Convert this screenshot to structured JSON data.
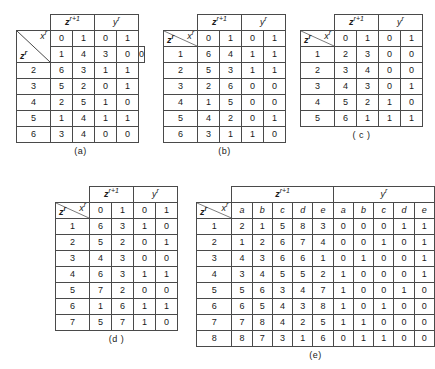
{
  "figure": {
    "headers": {
      "next_state": "z",
      "next_state_sup": "r+1",
      "output": "y",
      "output_sup": "r",
      "input_corner": "x",
      "input_corner_sup": "r",
      "state_corner": "z",
      "state_corner_sup": "r"
    },
    "tables": [
      {
        "id": "a",
        "caption": "(a)",
        "group_headers": [
          "z",
          "y"
        ],
        "input_columns": [
          "0",
          "1"
        ],
        "rows": [
          {
            "state": "1",
            "next": [
              "4",
              "3"
            ],
            "out": [
              "0",
              "0"
            ]
          },
          {
            "state": "2",
            "next": [
              "6",
              "3"
            ],
            "out": [
              "1",
              "1"
            ]
          },
          {
            "state": "3",
            "next": [
              "5",
              "2"
            ],
            "out": [
              "0",
              "1"
            ]
          },
          {
            "state": "4",
            "next": [
              "2",
              "5"
            ],
            "out": [
              "1",
              "0"
            ]
          },
          {
            "state": "5",
            "next": [
              "1",
              "4"
            ],
            "out": [
              "1",
              "1"
            ]
          },
          {
            "state": "6",
            "next": [
              "3",
              "4"
            ],
            "out": [
              "0",
              "0"
            ]
          }
        ]
      },
      {
        "id": "b",
        "caption": "(b)",
        "group_headers": [
          "z",
          "y"
        ],
        "input_columns": [
          "0",
          "1"
        ],
        "rows": [
          {
            "state": "1",
            "next": [
              "6",
              "4"
            ],
            "out": [
              "1",
              "1"
            ]
          },
          {
            "state": "2",
            "next": [
              "5",
              "3"
            ],
            "out": [
              "1",
              "1"
            ]
          },
          {
            "state": "3",
            "next": [
              "2",
              "6"
            ],
            "out": [
              "0",
              "0"
            ]
          },
          {
            "state": "4",
            "next": [
              "1",
              "5"
            ],
            "out": [
              "0",
              "0"
            ]
          },
          {
            "state": "5",
            "next": [
              "4",
              "2"
            ],
            "out": [
              "0",
              "1"
            ]
          },
          {
            "state": "6",
            "next": [
              "3",
              "1"
            ],
            "out": [
              "1",
              "0"
            ]
          }
        ]
      },
      {
        "id": "c",
        "caption": "( c )",
        "group_headers": [
          "z",
          "y"
        ],
        "input_columns": [
          "0",
          "1"
        ],
        "rows": [
          {
            "state": "1",
            "next": [
              "2",
              "3"
            ],
            "out": [
              "0",
              "0"
            ]
          },
          {
            "state": "2",
            "next": [
              "3",
              "4"
            ],
            "out": [
              "0",
              "0"
            ]
          },
          {
            "state": "3",
            "next": [
              "4",
              "3"
            ],
            "out": [
              "0",
              "1"
            ]
          },
          {
            "state": "4",
            "next": [
              "5",
              "2"
            ],
            "out": [
              "1",
              "0"
            ]
          },
          {
            "state": "5",
            "next": [
              "6",
              "1"
            ],
            "out": [
              "1",
              "1"
            ]
          }
        ]
      },
      {
        "id": "d",
        "caption": "(d )",
        "group_headers": [
          "z",
          "y"
        ],
        "input_columns": [
          "0",
          "1"
        ],
        "rows": [
          {
            "state": "1",
            "next": [
              "6",
              "3"
            ],
            "out": [
              "1",
              "0"
            ]
          },
          {
            "state": "2",
            "next": [
              "5",
              "2"
            ],
            "out": [
              "0",
              "1"
            ]
          },
          {
            "state": "3",
            "next": [
              "4",
              "3"
            ],
            "out": [
              "0",
              "0"
            ]
          },
          {
            "state": "4",
            "next": [
              "6",
              "3"
            ],
            "out": [
              "1",
              "1"
            ]
          },
          {
            "state": "5",
            "next": [
              "7",
              "2"
            ],
            "out": [
              "0",
              "0"
            ]
          },
          {
            "state": "6",
            "next": [
              "1",
              "6"
            ],
            "out": [
              "1",
              "1"
            ]
          },
          {
            "state": "7",
            "next": [
              "5",
              "7"
            ],
            "out": [
              "1",
              "0"
            ]
          }
        ]
      },
      {
        "id": "e",
        "caption": "(e)",
        "group_headers": [
          "z",
          "y"
        ],
        "input_columns": [
          "a",
          "b",
          "c",
          "d",
          "e"
        ],
        "rows": [
          {
            "state": "1",
            "next": [
              "2",
              "1",
              "5",
              "8",
              "3"
            ],
            "out": [
              "0",
              "0",
              "0",
              "1",
              "1"
            ]
          },
          {
            "state": "2",
            "next": [
              "1",
              "2",
              "6",
              "7",
              "4"
            ],
            "out": [
              "0",
              "0",
              "1",
              "0",
              "1"
            ]
          },
          {
            "state": "3",
            "next": [
              "4",
              "3",
              "6",
              "6",
              "1"
            ],
            "out": [
              "0",
              "1",
              "0",
              "0",
              "1"
            ]
          },
          {
            "state": "4",
            "next": [
              "3",
              "4",
              "5",
              "5",
              "2"
            ],
            "out": [
              "1",
              "0",
              "0",
              "0",
              "1"
            ]
          },
          {
            "state": "5",
            "next": [
              "5",
              "6",
              "3",
              "4",
              "7"
            ],
            "out": [
              "1",
              "0",
              "0",
              "1",
              "0"
            ]
          },
          {
            "state": "6",
            "next": [
              "6",
              "5",
              "4",
              "3",
              "8"
            ],
            "out": [
              "1",
              "0",
              "1",
              "0",
              "0"
            ]
          },
          {
            "state": "7",
            "next": [
              "7",
              "8",
              "4",
              "2",
              "5"
            ],
            "out": [
              "1",
              "1",
              "0",
              "0",
              "0"
            ]
          },
          {
            "state": "8",
            "next": [
              "8",
              "7",
              "3",
              "1",
              "6"
            ],
            "out": [
              "0",
              "1",
              "1",
              "0",
              "0"
            ]
          }
        ]
      }
    ]
  }
}
